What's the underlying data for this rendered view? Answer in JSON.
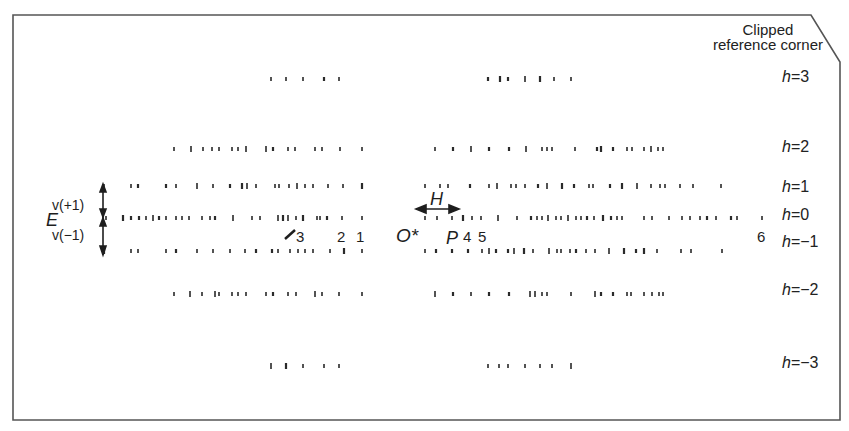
{
  "frame": {
    "border_color": "#555555",
    "corner_label_line1": "Clipped",
    "corner_label_line2": "reference corner"
  },
  "layer_labels": [
    {
      "h": "h",
      "eq": "=",
      "val": "3",
      "y": 77
    },
    {
      "h": "h",
      "eq": "=",
      "val": "2",
      "y": 147
    },
    {
      "h": "h",
      "eq": "=",
      "val": "1",
      "y": 187
    },
    {
      "h": "h",
      "eq": "=",
      "val": "0",
      "y": 215
    },
    {
      "h": "h",
      "eq": "=",
      "val": "−1",
      "y": 242
    },
    {
      "h": "h",
      "eq": "=",
      "val": "−2",
      "y": 290
    },
    {
      "h": "h",
      "eq": "=",
      "val": "−3",
      "y": 363
    }
  ],
  "annotations": {
    "v_plus": "v(+1)",
    "E": "E",
    "v_minus": "v(−1)",
    "H": "H",
    "origin": "O*",
    "P": "P",
    "n1": "1",
    "n2": "2",
    "n3": "3",
    "n4": "4",
    "n5": "5",
    "n6": "6"
  },
  "rows": [
    {
      "h": 3,
      "y": 79,
      "left": [
        271,
        286,
        303,
        324,
        339
      ],
      "right": [
        488,
        500,
        508,
        525,
        540,
        554,
        571
      ]
    },
    {
      "h": 2,
      "y": 149,
      "left": [
        174,
        191,
        203,
        212,
        219,
        232,
        238,
        246,
        266,
        273,
        288,
        295,
        315,
        322,
        340,
        362
      ],
      "right": [
        435,
        453,
        471,
        489,
        509,
        526,
        542,
        547,
        552,
        575,
        597,
        601,
        613,
        627,
        632,
        644,
        651,
        658,
        663
      ]
    },
    {
      "h": 1,
      "y": 186,
      "left": [
        104,
        131,
        138,
        166,
        176,
        197,
        213,
        230,
        242,
        247,
        256,
        275,
        279,
        289,
        297,
        305,
        313,
        328,
        343,
        362
      ],
      "right": [
        425,
        440,
        448,
        470,
        489,
        497,
        511,
        516,
        525,
        538,
        547,
        562,
        574,
        589,
        593,
        610,
        622,
        637,
        651,
        660,
        665,
        680,
        693,
        721
      ]
    },
    {
      "h": 0,
      "y": 218,
      "left": [
        106,
        123,
        131,
        139,
        146,
        153,
        159,
        166,
        176,
        182,
        189,
        202,
        210,
        215,
        233,
        252,
        260,
        278,
        283,
        288,
        296,
        303,
        317,
        320,
        327,
        342,
        362
      ],
      "right": [
        425,
        437,
        452,
        463,
        472,
        481,
        498,
        517,
        531,
        537,
        542,
        548,
        556,
        561,
        568,
        576,
        581,
        587,
        594,
        603,
        611,
        617,
        622,
        644,
        652,
        669,
        682,
        690,
        700,
        707,
        716,
        731,
        737,
        762
      ]
    },
    {
      "h": -1,
      "y": 251,
      "left": [
        104,
        131,
        138,
        166,
        176,
        197,
        213,
        230,
        245,
        256,
        272,
        278,
        290,
        298,
        305,
        313,
        330,
        344,
        362
      ],
      "right": [
        425,
        436,
        452,
        468,
        482,
        489,
        496,
        508,
        514,
        524,
        533,
        549,
        557,
        561,
        570,
        576,
        586,
        595,
        609,
        624,
        636,
        644,
        657,
        681,
        691,
        722
      ]
    },
    {
      "h": -2,
      "y": 294,
      "left": [
        174,
        190,
        202,
        215,
        219,
        232,
        238,
        246,
        266,
        273,
        288,
        296,
        315,
        322,
        339,
        362
      ],
      "right": [
        435,
        453,
        471,
        489,
        509,
        530,
        535,
        542,
        547,
        571,
        595,
        601,
        613,
        627,
        631,
        644,
        652,
        659,
        663
      ]
    },
    {
      "h": -3,
      "y": 366,
      "left": [
        271,
        286,
        303,
        324,
        339
      ],
      "right": [
        488,
        499,
        508,
        525,
        540,
        552,
        571
      ]
    }
  ]
}
